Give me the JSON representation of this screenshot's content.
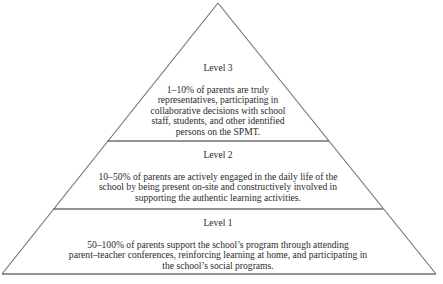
{
  "diagram": {
    "type": "pyramid",
    "line_color": "#6f6f6f",
    "levels": [
      {
        "label": "Level 3",
        "lines": [
          "1–10% of parents are truly",
          "representatives, participating in",
          "collaborative decisions with school",
          "staff, students, and other identified",
          "persons on the SPMT."
        ]
      },
      {
        "label": "Level 2",
        "lines": [
          "10–50% of parents are actively engaged in the daily life of the",
          "school by being present on-site and constructively involved in",
          "supporting the authentic learning activities."
        ]
      },
      {
        "label": "Level 1",
        "lines": [
          "50–100% of parents support the school’s program through attending",
          "parent–teacher conferences, reinforcing learning at home, and participating in",
          "the school’s social programs."
        ]
      }
    ]
  }
}
